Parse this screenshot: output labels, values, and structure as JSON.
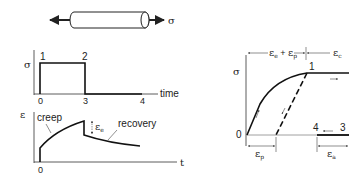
{
  "specimen": {
    "stress_label": "σ"
  },
  "stress_time_plot": {
    "y_label": "σ",
    "x_label": "time",
    "point_labels": [
      "1",
      "2"
    ],
    "x_ticks": [
      "0",
      "3",
      "4"
    ]
  },
  "strain_time_plot": {
    "y_label": "ε",
    "x_label": "t",
    "x_ticks": [
      "0"
    ],
    "annotations": {
      "creep": "creep",
      "recovery": "recovery",
      "elastic": "ε",
      "elastic_sub": "e"
    }
  },
  "stress_strain_plot": {
    "y_label": "σ",
    "origin_label": "0",
    "point_labels": [
      "1",
      "4",
      "3"
    ],
    "top_dim_left": {
      "sym1": "ε",
      "sub1": "e",
      "plus": " + ",
      "sym2": "ε",
      "sub2": "p"
    },
    "top_dim_right": {
      "sym": "ε",
      "sub": "c"
    },
    "bottom_dim_left": {
      "sym": "ε",
      "sub": "p"
    },
    "bottom_dim_right": {
      "sym": "ε",
      "sub": "a"
    }
  }
}
